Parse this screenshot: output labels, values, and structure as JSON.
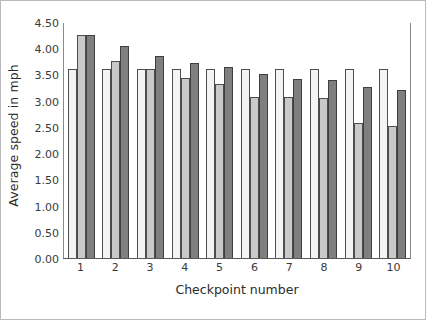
{
  "chart_data": {
    "type": "bar",
    "title": "",
    "xlabel": "Checkpoint number",
    "ylabel": "Average speed in mph",
    "categories": [
      "1",
      "2",
      "3",
      "4",
      "5",
      "6",
      "7",
      "8",
      "9",
      "10"
    ],
    "series": [
      {
        "name": "series-1",
        "color": "#f4f4f4",
        "values": [
          3.6,
          3.6,
          3.6,
          3.6,
          3.6,
          3.6,
          3.6,
          3.6,
          3.6,
          3.6
        ]
      },
      {
        "name": "series-2",
        "color": "#c9c9c9",
        "values": [
          4.25,
          3.75,
          3.6,
          3.43,
          3.32,
          3.07,
          3.07,
          3.05,
          2.57,
          2.52
        ]
      },
      {
        "name": "series-3",
        "color": "#7f7f7f",
        "values": [
          4.25,
          4.05,
          3.86,
          3.72,
          3.65,
          3.5,
          3.42,
          3.4,
          3.27,
          3.2
        ]
      }
    ],
    "ylim": [
      0.0,
      4.5
    ],
    "ytick_values": [
      0.0,
      0.5,
      1.0,
      1.5,
      2.0,
      2.5,
      3.0,
      3.5,
      4.0,
      4.5
    ],
    "ytick_labels": [
      "0.00",
      "0.50",
      "1.00",
      "1.50",
      "2.00",
      "2.50",
      "3.00",
      "3.50",
      "4.00",
      "4.50"
    ],
    "grid": false,
    "legend": "none",
    "legend_position": "none"
  }
}
